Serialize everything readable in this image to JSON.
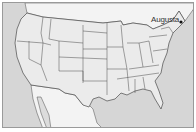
{
  "map": {
    "type": "us-states-outline",
    "colors": {
      "ocean": "#d6d6d6",
      "us_land": "#ebebeb",
      "foreign_land": "#f3f3f3",
      "border": "#4a4a4a",
      "frame": "#9a9a9a",
      "marker": "#111111"
    },
    "markers": [
      {
        "label": "Augusta",
        "state": "Maine"
      }
    ]
  }
}
